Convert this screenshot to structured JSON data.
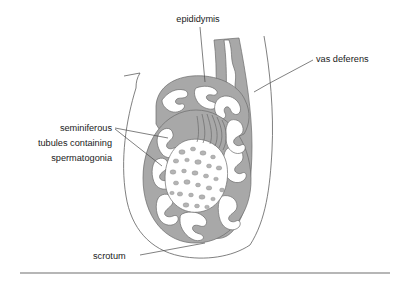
{
  "figure": {
    "background_color": "#ffffff",
    "tissue_color": "#a8a8a8",
    "lumen_color": "#ffffff",
    "outline_color": "#555555",
    "text_color": "#1a1a1a",
    "dot_color": "#b4b4b4"
  },
  "labels": {
    "epididymis": {
      "text": "epididymis",
      "x": 198,
      "y": 22,
      "anchor": "middle"
    },
    "vas_deferens": {
      "text": "vas deferens",
      "x": 316,
      "y": 62,
      "anchor": "start"
    },
    "seminiferous_line1": {
      "text": "seminiferous",
      "x": 112,
      "y": 131,
      "anchor": "end"
    },
    "seminiferous_line2": {
      "text": "tubules containing",
      "x": 112,
      "y": 146,
      "anchor": "end"
    },
    "seminiferous_line3": {
      "text": "spermatogonia",
      "x": 112,
      "y": 161,
      "anchor": "end"
    },
    "scrotum": {
      "text": "scrotum",
      "x": 93,
      "y": 259,
      "anchor": "start"
    }
  },
  "parts": [
    {
      "name": "epididymis",
      "description": "coiled duct cap over the upper pole of the testis"
    },
    {
      "name": "seminiferous-tubules",
      "description": "convoluted tubules containing spermatogonia within the testis"
    },
    {
      "name": "vas-deferens",
      "description": "thick walled duct ascending on the right side of the scrotum"
    },
    {
      "name": "scrotum",
      "description": "thin outer sac enclosing the testis"
    }
  ],
  "footer_rule": {
    "x1": 20,
    "x2": 390,
    "y": 273
  }
}
